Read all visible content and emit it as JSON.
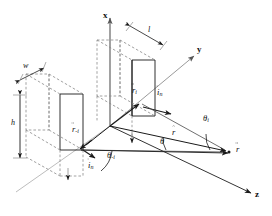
{
  "figure": {
    "kind": "3d-vector-geometry-diagram",
    "background_color": "#ffffff",
    "line_color": "#1a1a1a",
    "hidden_line_color": "#8a8a8a",
    "axis_color": "#4d4d4d"
  },
  "axes": [
    {
      "id": "x",
      "label": "x",
      "direction": "up"
    },
    {
      "id": "y",
      "label": "y",
      "direction": "upper-right"
    },
    {
      "id": "z",
      "label": "z",
      "direction": "lower-right"
    }
  ],
  "dimensions": [
    {
      "id": "w",
      "label": "w",
      "kind": "width",
      "arrow": "double"
    },
    {
      "id": "h",
      "label": "h",
      "kind": "height",
      "arrow": "double"
    },
    {
      "id": "l",
      "label": "l",
      "kind": "length",
      "arrow": "double"
    }
  ],
  "vectors": [
    {
      "id": "r_i",
      "label": "r",
      "sub": "i",
      "accent": "vector",
      "note": "source position vector of upper block"
    },
    {
      "id": "i_n_up",
      "label": "i",
      "sub": "n",
      "accent": "vector",
      "note": "surface normal unit vector of upper block"
    },
    {
      "id": "r_minus_i",
      "label": "r",
      "sub": "-i",
      "accent": "vector",
      "note": "source position vector of left block"
    },
    {
      "id": "i_n_low",
      "label": "i",
      "sub": "n",
      "accent": "vector",
      "note": "surface normal unit vector of left block"
    },
    {
      "id": "r_hat",
      "label": "r",
      "sub": "",
      "accent": "hat",
      "note": "unit direction vector to field point"
    },
    {
      "id": "r_field",
      "label": "r",
      "sub": "",
      "accent": "vector",
      "note": "field point position vector"
    }
  ],
  "angles": [
    {
      "id": "theta_i",
      "label": "θ",
      "sub": "i",
      "note": "angle between r_i ray and r-hat"
    },
    {
      "id": "theta",
      "label": "θ",
      "sub": "",
      "note": "angle between origin ray and r-hat"
    },
    {
      "id": "theta_minus_i",
      "label": "θ",
      "sub": "-i",
      "note": "angle at left block between its ray and reference"
    }
  ],
  "blocks": [
    {
      "id": "upper-block",
      "style": "wireframe",
      "edges": "solid-front-dashed-back"
    },
    {
      "id": "left-block",
      "style": "wireframe",
      "edges": "solid-front-dashed-back"
    }
  ]
}
